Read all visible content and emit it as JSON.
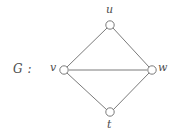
{
  "figure": {
    "name_label": "G :",
    "background_color": "#ffffff",
    "stroke_color": "#6b6b6b",
    "text_color": "#4d4d4d",
    "node_fill": "#ffffff",
    "width": 175,
    "height": 138
  },
  "graph": {
    "vertices": [
      {
        "id": "u",
        "label": "u",
        "x": 110,
        "y": 25,
        "r": 4.2,
        "label_x": 106,
        "label_y": 4
      },
      {
        "id": "v",
        "label": "v",
        "x": 64,
        "y": 70,
        "r": 4.2,
        "label_x": 50,
        "label_y": 62
      },
      {
        "id": "w",
        "label": "w",
        "x": 152,
        "y": 70,
        "r": 4.2,
        "label_x": 158,
        "label_y": 62
      },
      {
        "id": "t",
        "label": "t",
        "x": 110,
        "y": 112,
        "r": 4.2,
        "label_x": 107,
        "label_y": 119
      }
    ],
    "edges": [
      {
        "from": "v",
        "to": "u",
        "x1": 67,
        "y1": 67,
        "x2": 107,
        "y2": 28
      },
      {
        "from": "u",
        "to": "w",
        "x1": 113,
        "y1": 28,
        "x2": 149,
        "y2": 67
      },
      {
        "from": "v",
        "to": "w",
        "x1": 69,
        "y1": 70,
        "x2": 147,
        "y2": 70
      },
      {
        "from": "v",
        "to": "t",
        "x1": 67,
        "y1": 73,
        "x2": 107,
        "y2": 110
      },
      {
        "from": "t",
        "to": "w",
        "x1": 113,
        "y1": 110,
        "x2": 149,
        "y2": 73
      }
    ]
  }
}
